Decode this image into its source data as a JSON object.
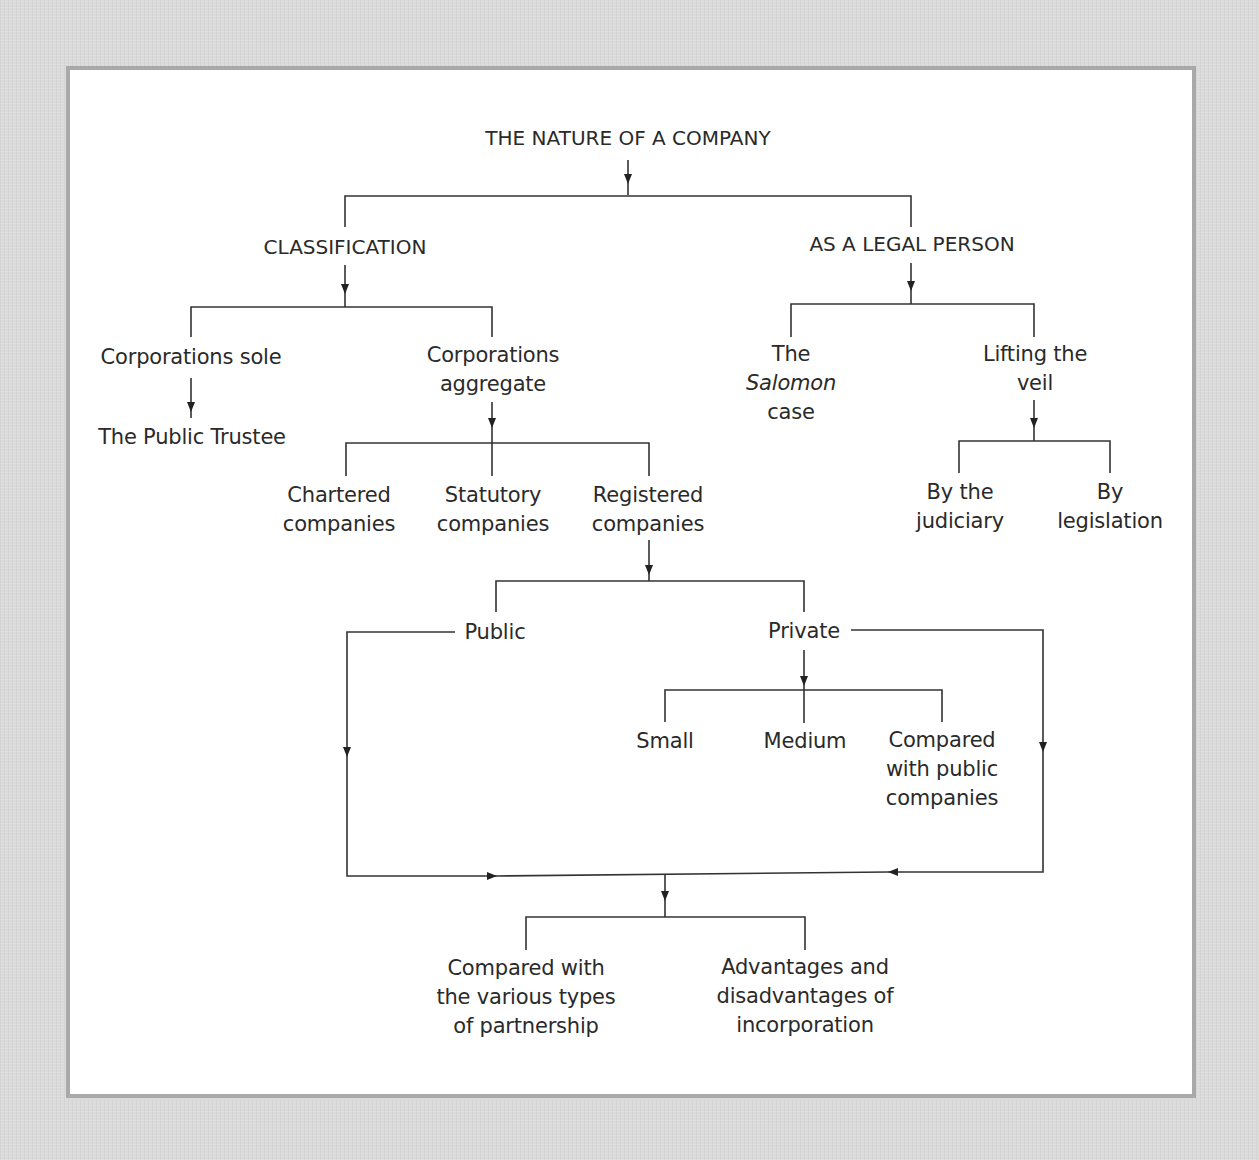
{
  "diagram": {
    "title": "THE NATURE OF A COMPANY",
    "branches": {
      "classification": {
        "label": "CLASSIFICATION",
        "corporations_sole": {
          "label": "Corporations sole",
          "example": "The Public Trustee"
        },
        "corporations_aggregate": {
          "line1": "Corporations",
          "line2": "aggregate",
          "chartered": {
            "line1": "Chartered",
            "line2": "companies"
          },
          "statutory": {
            "line1": "Statutory",
            "line2": "companies"
          },
          "registered": {
            "line1": "Registered",
            "line2": "companies",
            "public": {
              "label": "Public"
            },
            "private": {
              "label": "Private",
              "small": "Small",
              "medium": "Medium",
              "compared": {
                "line1": "Compared",
                "line2": "with public",
                "line3": "companies"
              }
            }
          }
        }
      },
      "legal_person": {
        "label": "AS A LEGAL PERSON",
        "salomon": {
          "line1": "The",
          "line2": "Salomon",
          "line3": "case"
        },
        "lifting_veil": {
          "line1": "Lifting the",
          "line2": "veil",
          "judiciary": {
            "line1": "By the",
            "line2": "judiciary"
          },
          "legislation": {
            "line1": "By",
            "line2": "legislation"
          }
        }
      }
    },
    "outcomes": {
      "partnership": {
        "line1": "Compared with",
        "line2": "the various types",
        "line3": "of partnership"
      },
      "incorporation": {
        "line1": "Advantages and",
        "line2": "disadvantages of",
        "line3": "incorporation"
      }
    },
    "colors": {
      "background": "#dadada",
      "panel": "#ffffff",
      "panel_border": "#a9a9a9",
      "text": "#2a2a2a",
      "lines": "#333333"
    }
  }
}
